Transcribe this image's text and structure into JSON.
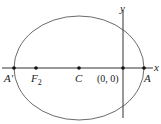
{
  "diagram": {
    "type": "ellipse-on-axes",
    "axes": {
      "x_label": "x",
      "y_label": "y"
    },
    "ellipse": {
      "cx": 79,
      "cy": 68,
      "rx": 65,
      "ry": 52,
      "stroke": "#6b6b6b"
    },
    "points": [
      {
        "id": "A-prime",
        "label": "A′",
        "x": 14,
        "y": 68
      },
      {
        "id": "F2",
        "label": "F",
        "sub": "2",
        "x": 36,
        "y": 68
      },
      {
        "id": "C",
        "label": "C",
        "x": 79,
        "y": 68
      },
      {
        "id": "origin",
        "label": "(0, 0)",
        "x": 123,
        "y": 68
      },
      {
        "id": "A",
        "label": "A",
        "x": 144,
        "y": 68
      }
    ],
    "colors": {
      "line": "#333333",
      "point": "#111111",
      "ellipse": "#6b6b6b"
    }
  }
}
